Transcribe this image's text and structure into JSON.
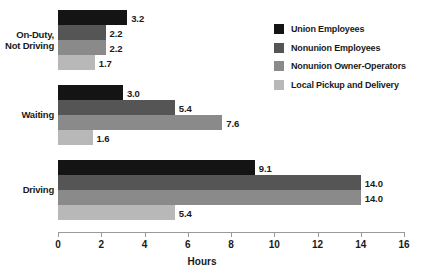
{
  "chart_data": {
    "type": "bar",
    "orientation": "horizontal",
    "title": "",
    "xlabel": "Hours",
    "ylabel": "",
    "xlim": [
      0,
      16
    ],
    "xticks": [
      0,
      2,
      4,
      6,
      8,
      10,
      12,
      14,
      16
    ],
    "xtick_labels": [
      "0",
      "2",
      "4",
      "6",
      "8",
      "10",
      "12",
      "14",
      "16"
    ],
    "grid": false,
    "legend_position": "top-right",
    "categories": [
      "On-Duty, Not Driving",
      "Waiting",
      "Driving"
    ],
    "series": [
      {
        "name": "Union Employees",
        "color": "#141414",
        "values": [
          3.2,
          3.0,
          9.1
        ],
        "labels": [
          "3.2",
          "3.0",
          "9.1"
        ]
      },
      {
        "name": "Nonunion Employees",
        "color": "#555555",
        "values": [
          2.2,
          5.4,
          14.0
        ],
        "labels": [
          "2.2",
          "5.4",
          "14.0"
        ]
      },
      {
        "name": "Nonunion Owner-Operators",
        "color": "#8a8a8a",
        "values": [
          2.2,
          7.6,
          14.0
        ],
        "labels": [
          "2.2",
          "7.6",
          "14.0"
        ]
      },
      {
        "name": "Local Pickup and Delivery",
        "color": "#b8b8b8",
        "values": [
          1.7,
          1.6,
          5.4
        ],
        "labels": [
          "1.7",
          "1.6",
          "5.4"
        ]
      }
    ]
  },
  "categories": {
    "0": {
      "line1": "On-Duty,",
      "line2": "Not Driving"
    },
    "1": {
      "line1": "Waiting",
      "line2": ""
    },
    "2": {
      "line1": "Driving",
      "line2": ""
    }
  },
  "axis": {
    "title": "Hours"
  },
  "colors": {
    "axis_line": "#9a9a9a",
    "text": "#1a1a1a",
    "background": "#ffffff"
  }
}
